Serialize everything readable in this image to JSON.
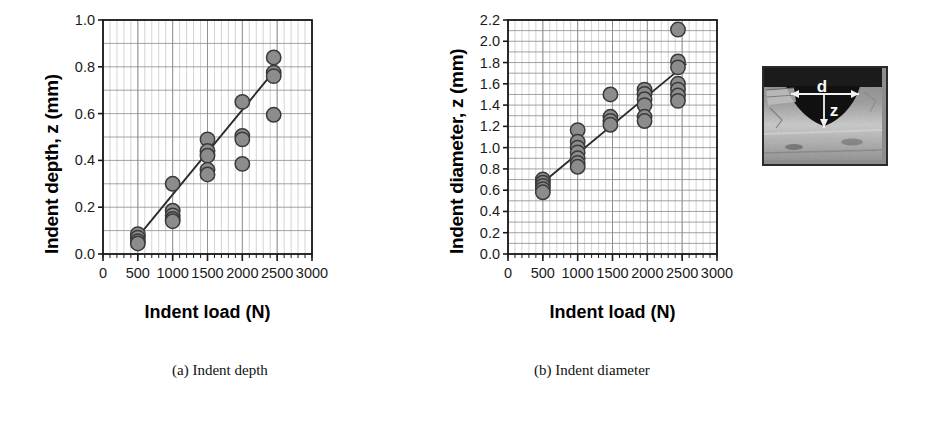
{
  "figure": {
    "panels": [
      {
        "id": "a",
        "caption": "(a) Indent depth",
        "ylabel": "Indent depth, z (mm)",
        "xlabel": "Indent load (N)"
      },
      {
        "id": "b",
        "caption": "(b) Indent diameter",
        "ylabel": "Indent diameter, z (mm)",
        "xlabel": "Indent load (N)"
      }
    ],
    "inset": {
      "label_diameter": "d",
      "label_depth": "z",
      "alt": "cross-section micrograph of an indent"
    },
    "colors": {
      "marker_fill": "#8c8c8c",
      "marker_edge": "#3a3a3a",
      "trendline": "#2b2b2b",
      "axis": "#1a1a1a",
      "gridline_major": "#8a8a8a",
      "gridline_minor": "#c2c2c2",
      "background": "#ffffff"
    }
  },
  "chart_data": [
    {
      "type": "scatter",
      "panel": "a",
      "title": "(a) Indent depth",
      "xlabel": "Indent load (N)",
      "ylabel": "Indent depth, z (mm)",
      "xlim": [
        0,
        3000
      ],
      "ylim": [
        0.0,
        1.0
      ],
      "xticks": [
        0,
        500,
        1000,
        1500,
        2000,
        2500,
        3000
      ],
      "yticks": [
        0.0,
        0.2,
        0.4,
        0.6,
        0.8,
        1.0
      ],
      "xtick_labels": [
        "0",
        "500",
        "1000",
        "1500",
        "2000",
        "2500",
        "3000"
      ],
      "ytick_labels": [
        "0.0",
        "0.2",
        "0.4",
        "0.6",
        "0.8",
        "1.0"
      ],
      "grid": true,
      "grid_minor_x_step": 100,
      "grid_major_y_step": 0.1,
      "legend": "none",
      "points": [
        {
          "x": 500,
          "y": 0.085
        },
        {
          "x": 500,
          "y": 0.07
        },
        {
          "x": 500,
          "y": 0.055
        },
        {
          "x": 500,
          "y": 0.045
        },
        {
          "x": 1000,
          "y": 0.3
        },
        {
          "x": 1000,
          "y": 0.185
        },
        {
          "x": 1000,
          "y": 0.165
        },
        {
          "x": 1000,
          "y": 0.15
        },
        {
          "x": 1000,
          "y": 0.14
        },
        {
          "x": 1500,
          "y": 0.49
        },
        {
          "x": 1500,
          "y": 0.44
        },
        {
          "x": 1500,
          "y": 0.42
        },
        {
          "x": 1500,
          "y": 0.36
        },
        {
          "x": 1500,
          "y": 0.34
        },
        {
          "x": 2000,
          "y": 0.65
        },
        {
          "x": 2000,
          "y": 0.505
        },
        {
          "x": 2000,
          "y": 0.49
        },
        {
          "x": 2000,
          "y": 0.385
        },
        {
          "x": 2450,
          "y": 0.84
        },
        {
          "x": 2450,
          "y": 0.775
        },
        {
          "x": 2450,
          "y": 0.76
        },
        {
          "x": 2450,
          "y": 0.595
        }
      ],
      "trendline": {
        "x0": 450,
        "y0": 0.055,
        "x1": 2480,
        "y1": 0.79
      }
    },
    {
      "type": "scatter",
      "panel": "b",
      "title": "(b) Indent diameter",
      "xlabel": "Indent load (N)",
      "ylabel": "Indent diameter, z (mm)",
      "xlim": [
        0,
        3000
      ],
      "ylim": [
        0.0,
        2.2
      ],
      "xticks": [
        0,
        500,
        1000,
        1500,
        2000,
        2500,
        3000
      ],
      "yticks": [
        0.0,
        0.2,
        0.4,
        0.6,
        0.8,
        1.0,
        1.2,
        1.4,
        1.6,
        1.8,
        2.0,
        2.2
      ],
      "xtick_labels": [
        "0",
        "500",
        "1000",
        "1500",
        "2000",
        "2500",
        "3000"
      ],
      "ytick_labels": [
        "0.0",
        "0.2",
        "0.4",
        "0.6",
        "0.8",
        "1.0",
        "1.2",
        "1.4",
        "1.6",
        "1.8",
        "2.0",
        "2.2"
      ],
      "grid": true,
      "grid_minor_x_step": 100,
      "grid_major_y_step": 0.1,
      "legend": "none",
      "points": [
        {
          "x": 500,
          "y": 0.7
        },
        {
          "x": 500,
          "y": 0.67
        },
        {
          "x": 500,
          "y": 0.64
        },
        {
          "x": 500,
          "y": 0.61
        },
        {
          "x": 500,
          "y": 0.58
        },
        {
          "x": 1000,
          "y": 1.165
        },
        {
          "x": 1000,
          "y": 1.055
        },
        {
          "x": 1000,
          "y": 1.0
        },
        {
          "x": 1000,
          "y": 0.955
        },
        {
          "x": 1000,
          "y": 0.9
        },
        {
          "x": 1000,
          "y": 0.855
        },
        {
          "x": 1000,
          "y": 0.82
        },
        {
          "x": 1470,
          "y": 1.5
        },
        {
          "x": 1470,
          "y": 1.29
        },
        {
          "x": 1470,
          "y": 1.25
        },
        {
          "x": 1470,
          "y": 1.215
        },
        {
          "x": 1960,
          "y": 1.545
        },
        {
          "x": 1960,
          "y": 1.505
        },
        {
          "x": 1960,
          "y": 1.455
        },
        {
          "x": 1960,
          "y": 1.4
        },
        {
          "x": 1960,
          "y": 1.29
        },
        {
          "x": 1960,
          "y": 1.25
        },
        {
          "x": 2440,
          "y": 2.11
        },
        {
          "x": 2440,
          "y": 1.81
        },
        {
          "x": 2440,
          "y": 1.755
        },
        {
          "x": 2440,
          "y": 1.6
        },
        {
          "x": 2440,
          "y": 1.545
        },
        {
          "x": 2440,
          "y": 1.49
        },
        {
          "x": 2440,
          "y": 1.44
        }
      ],
      "trendline": {
        "x0": 440,
        "y0": 0.64,
        "x1": 2560,
        "y1": 1.79
      }
    }
  ]
}
